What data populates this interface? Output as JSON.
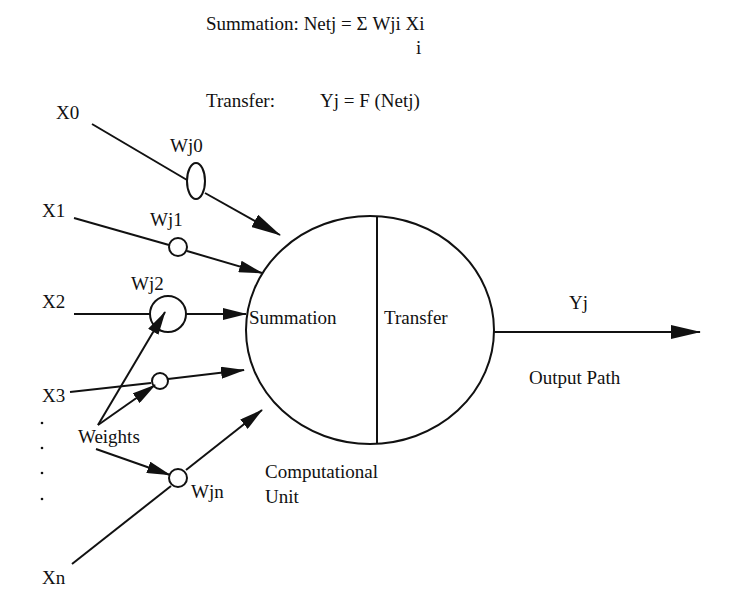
{
  "equations": {
    "summation": "Summation: Netj = Σ Wji Xi",
    "summation_index": "i",
    "transfer_label": "Transfer:",
    "transfer_eq": "Yj = F (Netj)"
  },
  "inputs": [
    {
      "label": "X0",
      "weight": "Wj0"
    },
    {
      "label": "X1",
      "weight": "Wj1"
    },
    {
      "label": "X2",
      "weight": "Wj2"
    },
    {
      "label": "X3",
      "weight": ""
    },
    {
      "label": "Xn",
      "weight": "Wjn"
    }
  ],
  "weights_label": "Weights",
  "unit": {
    "left": "Summation",
    "right": "Transfer",
    "caption_line1": "Computational",
    "caption_line2": "Unit"
  },
  "output": {
    "label": "Yj",
    "caption": "Output Path"
  },
  "colors": {
    "ink": "#111111",
    "background": "#ffffff"
  }
}
